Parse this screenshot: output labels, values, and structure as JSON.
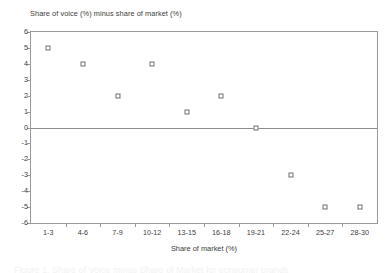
{
  "chart_data": {
    "type": "scatter",
    "title": "Share of voice (%) minus share of market (%)",
    "xlabel": "Share of market (%)",
    "ylabel": "",
    "categories": [
      "1-3",
      "4-6",
      "7-9",
      "10-12",
      "13-15",
      "16-18",
      "19-21",
      "22-24",
      "25-27",
      "28-30"
    ],
    "values": [
      5,
      4,
      2,
      4,
      1,
      2,
      0,
      -3,
      -5,
      -5
    ],
    "ylim": [
      -6,
      6
    ],
    "ytick_labels": [
      "6",
      "5",
      "4",
      "3",
      "2",
      "1",
      "0",
      "-1",
      "-2",
      "-3",
      "-4",
      "-5",
      "-6"
    ],
    "ytick_values": [
      6,
      5,
      4,
      3,
      2,
      1,
      0,
      -1,
      -2,
      -3,
      -4,
      -5,
      -6
    ],
    "grid": false,
    "legend": false,
    "zero_line": 0,
    "marker": "open-square",
    "colors": {
      "marker_border": "#6e6e6e",
      "marker_fill": "#ffffff",
      "axis": "#9a9a9a",
      "zero_line": "#8d8d8d",
      "text": "#3c3c3c",
      "background": "#ffffff"
    }
  },
  "caption": {
    "text": "Figure 1. Share of Voice minus Share of Market for consumer brands"
  }
}
